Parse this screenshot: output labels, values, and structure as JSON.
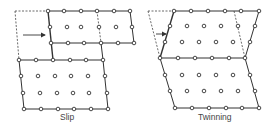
{
  "diagram": {
    "panels": [
      {
        "id": "slip",
        "label": "Slip"
      },
      {
        "id": "twinning",
        "label": "Twinning"
      }
    ],
    "colors": {
      "line": "#333333",
      "dot_stroke": "#333333",
      "dot_fill": "#ffffff",
      "label": "#444444"
    }
  }
}
